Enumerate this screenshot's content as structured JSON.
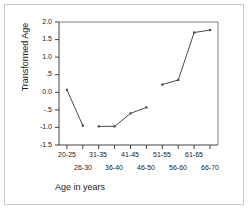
{
  "figure": {
    "background_color": "#ffffff",
    "frame_color": "#c8c8c8",
    "axis_color": "#404040",
    "line_color": "#4a4a4a"
  },
  "chart_data": {
    "type": "line",
    "title": "",
    "subtitle": "",
    "xlabel": "Age in years",
    "ylabel": "Transformed Age",
    "categories": [
      "20-25",
      "26-30",
      "31-35",
      "36-40",
      "41-45",
      "46-50",
      "51-55",
      "56-60",
      "61-65",
      "66-70"
    ],
    "values": [
      0.07,
      -0.95,
      -0.97,
      -0.97,
      -0.6,
      -0.43,
      0.22,
      0.35,
      1.7,
      1.77
    ],
    "segments": [
      {
        "from": "20-25",
        "to": "26-30"
      },
      {
        "from": "31-35",
        "to": "36-40"
      },
      {
        "from": "36-40",
        "to": "41-45"
      },
      {
        "from": "41-45",
        "to": "46-50"
      },
      {
        "from": "51-55",
        "to": "56-60"
      },
      {
        "from": "56-60",
        "to": "61-65"
      },
      {
        "from": "61-65",
        "to": "66-70"
      }
    ],
    "gaps": [
      {
        "after": "26-30",
        "before": "31-35"
      },
      {
        "after": "46-50",
        "before": "51-55"
      }
    ],
    "ylim": [
      -1.5,
      2.0
    ],
    "ytick_values": [
      2.0,
      1.5,
      1.0,
      0.5,
      0.0,
      -0.5,
      -1.0,
      -1.5
    ],
    "ytick_labels": [
      "2.0",
      "1.5",
      "1.0",
      ".5",
      "0.0",
      "-.5",
      "-1.0",
      "-1.5"
    ],
    "xtick_labels_upper": [
      "20-25",
      "31-35",
      "41-45",
      "51-55",
      "61-65"
    ],
    "xtick_labels_lower": [
      "26-30",
      "36-40",
      "46-50",
      "56-60",
      "66-70"
    ],
    "grid": false,
    "legend": null,
    "legend_position": "none",
    "markers": true
  }
}
